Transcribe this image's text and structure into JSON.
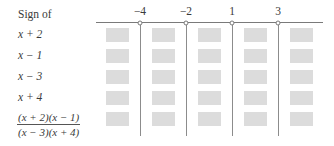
{
  "header": {
    "title": "Sign of"
  },
  "axis": {
    "critical_points": [
      {
        "label": "−4",
        "x": 140
      },
      {
        "label": "−2",
        "x": 186
      },
      {
        "label": "1",
        "x": 232
      },
      {
        "label": "3",
        "x": 278
      }
    ]
  },
  "rows": [
    {
      "label": "x + 2"
    },
    {
      "label": "x − 1"
    },
    {
      "label": "x − 3"
    },
    {
      "label": "x + 4"
    },
    {
      "numerator": "(x + 2)(x − 1)",
      "denominator": "(x − 3)(x + 4)"
    }
  ],
  "colors": {
    "box_fill": "#dcdcdc",
    "line": "#8c8c8c"
  }
}
